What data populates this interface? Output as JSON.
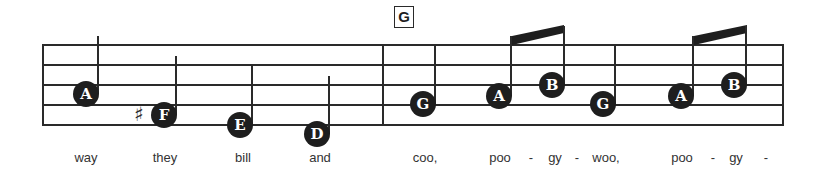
{
  "chord": "G",
  "accent_color": "#1e1e1e",
  "notes": [
    {
      "letter": "A",
      "x": 86,
      "y": 94,
      "stem_top": 36,
      "stem_side": "right"
    },
    {
      "letter": "F",
      "x": 164,
      "y": 115,
      "stem_top": 56,
      "stem_side": "right",
      "sharp": true
    },
    {
      "letter": "E",
      "x": 240,
      "y": 125,
      "stem_top": 66,
      "stem_side": "right"
    },
    {
      "letter": "D",
      "x": 317,
      "y": 134,
      "stem_top": 76,
      "stem_side": "right"
    },
    {
      "letter": "G",
      "x": 423,
      "y": 104,
      "stem_top": 46,
      "stem_side": "right"
    },
    {
      "letter": "A",
      "x": 499,
      "y": 96,
      "stem_top": 36,
      "stem_side": "right"
    },
    {
      "letter": "B",
      "x": 552,
      "y": 85,
      "stem_top": 26,
      "stem_side": "right"
    },
    {
      "letter": "G",
      "x": 603,
      "y": 104,
      "stem_top": 46,
      "stem_side": "right"
    },
    {
      "letter": "A",
      "x": 681,
      "y": 96,
      "stem_top": 36,
      "stem_side": "right"
    },
    {
      "letter": "B",
      "x": 734,
      "y": 85,
      "stem_top": 26,
      "stem_side": "right"
    }
  ],
  "lyrics": [
    {
      "text": "way",
      "x": 86
    },
    {
      "text": "they",
      "x": 165
    },
    {
      "text": "bill",
      "x": 243
    },
    {
      "text": "and",
      "x": 320
    },
    {
      "text": "coo,",
      "x": 425
    },
    {
      "text": "poo",
      "x": 500
    },
    {
      "text": "-",
      "x": 531
    },
    {
      "text": "gy",
      "x": 555
    },
    {
      "text": "-",
      "x": 577
    },
    {
      "text": "woo,",
      "x": 606
    },
    {
      "text": "poo",
      "x": 682
    },
    {
      "text": "-",
      "x": 713
    },
    {
      "text": "gy",
      "x": 736
    },
    {
      "text": "-",
      "x": 766
    }
  ],
  "beams": [
    {
      "x1": 512,
      "x2": 564
    },
    {
      "x1": 694,
      "x2": 747
    }
  ]
}
